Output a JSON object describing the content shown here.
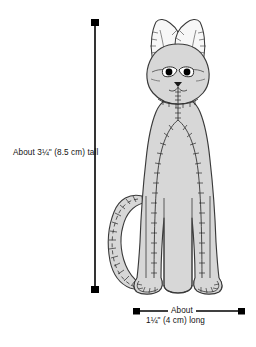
{
  "illustration": {
    "subject": "stuffed-cat-toy",
    "description": "Line drawing of a sitting stuffed cat plush toy with visible stitch seams, long ears, curved tail, four limbs",
    "fill_color": "#d7d7d7",
    "ear_fill_color": "#f7f7f7",
    "outline_color": "#3a3a3a",
    "stitch_color": "#2b2b2b",
    "eye_fill_color": "#ffffff",
    "pupil_color": "#000000"
  },
  "dimensions": {
    "height": {
      "label": "About 3¼\" (8.5 cm) tall",
      "orientation": "vertical",
      "arrow_color": "#000000"
    },
    "width": {
      "label_line1": "About",
      "label_line2": "1¼\" (4 cm) long",
      "orientation": "horizontal",
      "arrow_color": "#000000"
    }
  }
}
